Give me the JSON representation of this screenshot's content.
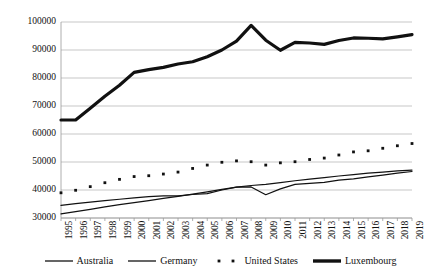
{
  "chart_data": {
    "type": "line",
    "title": "",
    "subtitle": "",
    "xlabel": "",
    "ylabel": "",
    "grid": true,
    "legend_position": "bottom",
    "x": [
      1995,
      1996,
      1997,
      1998,
      1999,
      2000,
      2001,
      2002,
      2003,
      2004,
      2005,
      2006,
      2007,
      2008,
      2009,
      2010,
      2011,
      2012,
      2013,
      2014,
      2015,
      2016,
      2017,
      2018,
      2019
    ],
    "xtick_labels": [
      "1995",
      "1996",
      "1997",
      "1998",
      "1999",
      "2000",
      "2001",
      "2002",
      "2003",
      "2004",
      "2005",
      "2006",
      "2007",
      "2008",
      "2009",
      "2010",
      "2011",
      "2012",
      "2013",
      "2014",
      "2015",
      "2016",
      "2017",
      "2018",
      "2019"
    ],
    "ytick_labels": [
      "100000",
      "90000",
      "80000",
      "70000",
      "60000",
      "50000",
      "40000",
      "30000"
    ],
    "ytick_values": [
      100000,
      90000,
      80000,
      70000,
      60000,
      50000,
      40000,
      30000
    ],
    "ylim": [
      30000,
      100000
    ],
    "xlim": [
      1995,
      2019
    ],
    "series": [
      {
        "name": "Australia",
        "style": "thin-line",
        "color": "#111111",
        "values": [
          31500,
          32300,
          33100,
          34000,
          34800,
          35500,
          36200,
          37000,
          37700,
          38500,
          39300,
          40200,
          41000,
          41600,
          42000,
          42600,
          43300,
          43900,
          44400,
          45000,
          45500,
          46000,
          46400,
          46800,
          47100
        ]
      },
      {
        "name": "Germany",
        "style": "thin-line",
        "color": "#111111",
        "values": [
          34500,
          35100,
          35700,
          36200,
          36700,
          37200,
          37600,
          37900,
          37900,
          38400,
          38700,
          40000,
          41000,
          41100,
          38300,
          40400,
          42000,
          42400,
          42700,
          43500,
          44000,
          44700,
          45300,
          46000,
          46600
        ]
      },
      {
        "name": "United States",
        "style": "dotted",
        "color": "#111111",
        "values": [
          39000,
          39900,
          41200,
          42600,
          43800,
          44800,
          45100,
          45700,
          46400,
          47700,
          48900,
          49900,
          50400,
          50100,
          48900,
          49700,
          50100,
          50900,
          51400,
          52500,
          53600,
          54000,
          54900,
          55800,
          56600
        ]
      },
      {
        "name": "Luxembourg",
        "style": "thick-line",
        "color": "#111111",
        "values": [
          65000,
          65000,
          69200,
          73500,
          77400,
          82000,
          83000,
          83800,
          85000,
          85800,
          87600,
          90000,
          93200,
          98800,
          93500,
          89900,
          92700,
          92500,
          92000,
          93400,
          94300,
          94200,
          94000,
          94700,
          95500
        ]
      }
    ]
  },
  "legend": {
    "items": [
      {
        "label": "Australia",
        "icon": "thin-line-swatch"
      },
      {
        "label": "Germany",
        "icon": "thin-line-swatch"
      },
      {
        "label": "United States",
        "icon": "dotted-swatch"
      },
      {
        "label": "Luxembourg",
        "icon": "thick-line-swatch"
      }
    ]
  }
}
